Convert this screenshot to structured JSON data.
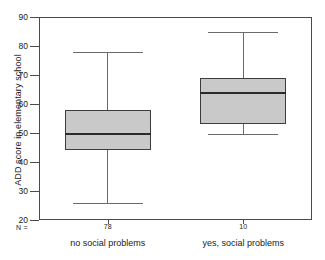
{
  "chart_data": {
    "type": "box",
    "title": "",
    "xlabel": "",
    "ylabel": "ADD score in elementary school",
    "ylim": [
      20,
      90
    ],
    "ytick_values": [
      90,
      80,
      70,
      60,
      50,
      40,
      30,
      20
    ],
    "ytick_labels": [
      "90",
      "80",
      "70",
      "60",
      "50",
      "40",
      "30",
      "20"
    ],
    "grid": false,
    "legend": false,
    "n_legend_label": "N =",
    "categories": [
      "no social problems",
      "yes, social problems"
    ],
    "counts": [
      "78",
      "10"
    ],
    "boxes": [
      {
        "category": "no social problems",
        "n": "78",
        "whisker_low": 26,
        "q1": 44,
        "median": 50,
        "q3": 58,
        "whisker_high": 78
      },
      {
        "category": "yes, social problems",
        "n": "10",
        "whisker_low": 49.5,
        "q1": 53,
        "median": 64,
        "q3": 69,
        "whisker_high": 85
      }
    ],
    "colors": {
      "box_fill": "#c9c9c9",
      "box_edge": "#3d3d3d",
      "median": "#2b2b2b",
      "whisker": "#6a6a6a",
      "axis": "#4a4a4a",
      "background": "#ffffff",
      "text": "#1a1a1a"
    }
  }
}
